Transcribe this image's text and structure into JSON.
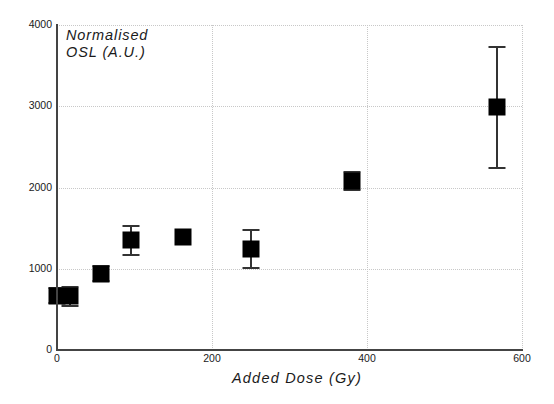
{
  "chart_data": {
    "type": "scatter",
    "title": "",
    "xlabel": "Added Dose (Gy)",
    "ylabel": "Normalised\nOSL (A.U.)",
    "xlim": [
      0,
      600
    ],
    "ylim": [
      0,
      4000
    ],
    "xticks": [
      0,
      200,
      400,
      600
    ],
    "yticks": [
      0,
      1000,
      2000,
      3000,
      4000
    ],
    "xtick_labels": [
      "0",
      "200",
      "400",
      "600"
    ],
    "ytick_labels": [
      "0",
      "1000",
      "2000",
      "3000",
      "4000"
    ],
    "grid": true,
    "legend": null,
    "marker": "filled-square",
    "marker_color": "#000000",
    "errorbar_color": "#333333",
    "x": [
      0,
      17,
      57,
      96,
      163,
      250,
      381,
      568
    ],
    "y": [
      670,
      660,
      940,
      1350,
      1385,
      1245,
      2080,
      2985
    ],
    "yerr": [
      90,
      120,
      90,
      180,
      0,
      235,
      115,
      740
    ],
    "points": [
      {
        "x": 0,
        "y": 670,
        "yerr": 90
      },
      {
        "x": 17,
        "y": 660,
        "yerr": 120
      },
      {
        "x": 57,
        "y": 940,
        "yerr": 90
      },
      {
        "x": 96,
        "y": 1350,
        "yerr": 180
      },
      {
        "x": 163,
        "y": 1385,
        "yerr": 0
      },
      {
        "x": 250,
        "y": 1245,
        "yerr": 235
      },
      {
        "x": 381,
        "y": 2080,
        "yerr": 115
      },
      {
        "x": 568,
        "y": 2985,
        "yerr": 740
      }
    ]
  }
}
